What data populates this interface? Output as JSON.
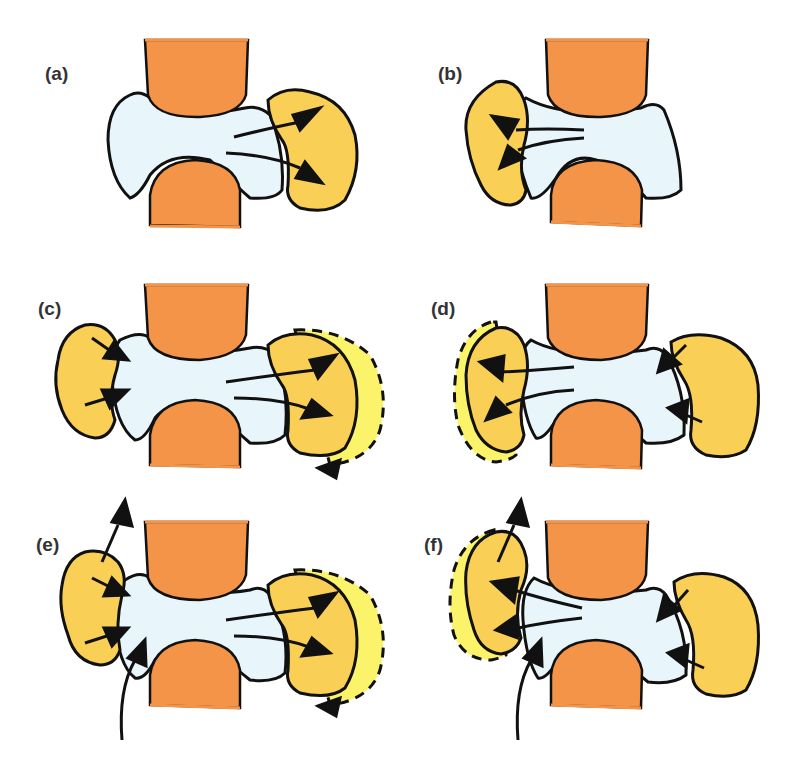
{
  "figure": {
    "panels": [
      {
        "id": "a",
        "label": "(a)",
        "left_lobe": false,
        "right_lobe": true,
        "left_halo": false,
        "right_halo": false,
        "arrows": "right-outward",
        "vertical_arrows": false
      },
      {
        "id": "b",
        "label": "(b)",
        "left_lobe": true,
        "right_lobe": false,
        "left_halo": false,
        "right_halo": false,
        "arrows": "left-outward",
        "vertical_arrows": false
      },
      {
        "id": "c",
        "label": "(c)",
        "left_lobe": true,
        "right_lobe": true,
        "left_halo": false,
        "right_halo": true,
        "arrows": "left-inward, right-outward",
        "vertical_arrows": false
      },
      {
        "id": "d",
        "label": "(d)",
        "left_lobe": true,
        "right_lobe": true,
        "left_halo": true,
        "right_halo": false,
        "arrows": "left-outward, right-inward",
        "vertical_arrows": false
      },
      {
        "id": "e",
        "label": "(e)",
        "left_lobe": true,
        "right_lobe": true,
        "left_halo": false,
        "right_halo": true,
        "arrows": "left-inward, right-outward",
        "vertical_arrows": true
      },
      {
        "id": "f",
        "label": "(f)",
        "left_lobe": true,
        "right_lobe": true,
        "left_halo": true,
        "right_halo": false,
        "arrows": "left-outward, right-inward",
        "vertical_arrows": true
      }
    ],
    "colors": {
      "condyle": "#f39449",
      "central_body": "#e8f6fb",
      "lobe": "#f9cf55",
      "halo": "#fbf46a",
      "outline": "#111111",
      "label": "#333333"
    },
    "footer": ""
  }
}
